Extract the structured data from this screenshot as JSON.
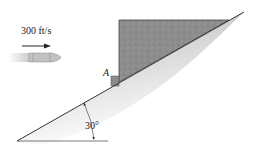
{
  "figure": {
    "velocity_label": "300 ft/s",
    "point_label": "A",
    "angle_label": "30°",
    "incline_angle_deg": 30,
    "colors": {
      "block_fill": "#8a8a8a",
      "slope_shade": "#c8c8c8",
      "line": "#333333",
      "bullet": "#bdbdbd"
    }
  }
}
